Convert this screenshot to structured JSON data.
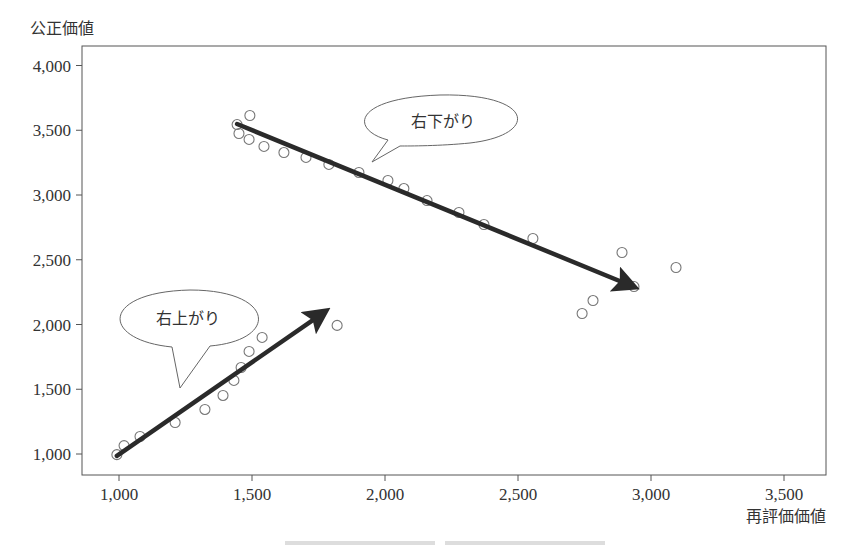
{
  "chart_data": {
    "type": "scatter",
    "title": "",
    "xlabel": "再評価価値",
    "ylabel": "公正価値",
    "xlim": [
      880,
      3650
    ],
    "ylim": [
      840,
      4160
    ],
    "x_ticks": [
      1000,
      1500,
      2000,
      2500,
      3000,
      3500
    ],
    "x_tick_labels": [
      "1,000",
      "1,500",
      "2,000",
      "2,500",
      "3,000",
      "3,500"
    ],
    "y_ticks": [
      1000,
      1500,
      2000,
      2500,
      3000,
      3500,
      4000
    ],
    "y_tick_labels": [
      "1,000",
      "1,500",
      "2,000",
      "2,500",
      "3,000",
      "3,500",
      "4,000"
    ],
    "grid": false,
    "legend": null,
    "series": [
      {
        "name": "points",
        "marker": "open-circle",
        "points": [
          [
            992,
            995
          ],
          [
            1019,
            1065
          ],
          [
            1079,
            1135
          ],
          [
            1211,
            1243
          ],
          [
            1323,
            1344
          ],
          [
            1391,
            1452
          ],
          [
            1432,
            1568
          ],
          [
            1459,
            1668
          ],
          [
            1489,
            1792
          ],
          [
            1538,
            1900
          ],
          [
            1820,
            1993
          ],
          [
            1444,
            3544
          ],
          [
            1492,
            3614
          ],
          [
            1451,
            3475
          ],
          [
            1489,
            3429
          ],
          [
            1545,
            3375
          ],
          [
            1620,
            3328
          ],
          [
            1703,
            3290
          ],
          [
            1789,
            3236
          ],
          [
            1902,
            3174
          ],
          [
            2011,
            3112
          ],
          [
            2071,
            3050
          ],
          [
            2158,
            2957
          ],
          [
            2278,
            2865
          ],
          [
            2372,
            2772
          ],
          [
            2556,
            2664
          ],
          [
            2891,
            2556
          ],
          [
            3094,
            2440
          ],
          [
            2936,
            2293
          ],
          [
            2782,
            2185
          ],
          [
            2741,
            2085
          ]
        ]
      }
    ],
    "annotations": [
      {
        "type": "arrow",
        "label": "upward-trend-arrow",
        "from": [
          992,
          985
        ],
        "to": [
          1756,
          2073
        ]
      },
      {
        "type": "arrow",
        "label": "downward-trend-arrow",
        "from": [
          1444,
          3548
        ],
        "to": [
          2914,
          2309
        ]
      },
      {
        "type": "callout",
        "text": "右上がり",
        "anchor": [
          1237,
          1510
        ]
      },
      {
        "type": "callout",
        "text": "右下がり",
        "anchor": [
          1936,
          3074
        ]
      }
    ]
  },
  "labels": {
    "y_axis_title": "公正価値",
    "x_axis_title": "再評価価値",
    "callout_up": "右上がり",
    "callout_down": "右下がり"
  },
  "style": {
    "axis_color": "#555555",
    "marker_color": "#777777",
    "arrow_color": "#2a2a2a",
    "bubble_stroke": "#666666"
  }
}
